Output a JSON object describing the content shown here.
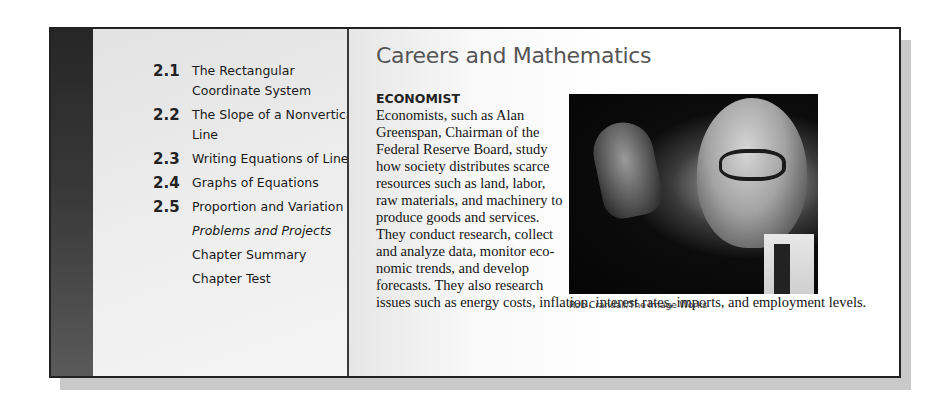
{
  "toc": {
    "items": [
      {
        "number": "2.1",
        "label": "The Rectangular Coordinate System"
      },
      {
        "number": "2.2",
        "label": "The Slope of a Nonvertical Line"
      },
      {
        "number": "2.3",
        "label": "Writing Equations of Lines"
      },
      {
        "number": "2.4",
        "label": "Graphs of Equations"
      },
      {
        "number": "2.5",
        "label": "Proportion and Variation"
      },
      {
        "number": "",
        "label": "Problems and Projects"
      },
      {
        "number": "",
        "label": "Chapter Summary"
      },
      {
        "number": "",
        "label": "Chapter Test"
      }
    ]
  },
  "careers": {
    "title": "Careers and Mathematics",
    "heading": "ECONOMIST",
    "body_narrow": "Economists, such as Alan Greenspan, Chairman of the Federal Reserve Board, study how society distributes scarce resources such as land, labor, raw materials, and machinery to produce goods and services. They conduct research, collect and analyze data, monitor eco-nomic trends, and develop forecasts. They also research",
    "body_wide": "issues such as energy costs, inflation, interest rates, imports, and employment levels.",
    "photo_alt": "Photo of Alan Greenspan gesturing with raised hand",
    "photo_caption": "Rob Crandall/The Image Works"
  }
}
